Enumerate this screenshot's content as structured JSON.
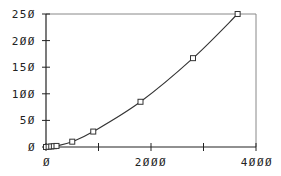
{
  "chart_data": {
    "type": "line",
    "title": "",
    "xlabel": "",
    "ylabel": "",
    "xlim": [
      0,
      4000
    ],
    "ylim": [
      0,
      250
    ],
    "grid": false,
    "legend": null,
    "x_ticks": [
      0,
      1000,
      2000,
      3000,
      4000
    ],
    "x_tick_labels": [
      "0",
      "",
      "2000",
      "",
      "4000"
    ],
    "y_ticks": [
      0,
      50,
      100,
      150,
      200,
      250
    ],
    "y_tick_labels": [
      "0",
      "50",
      "100",
      "150",
      "200",
      "250"
    ],
    "series": [
      {
        "name": "series-1",
        "marker": "square",
        "line": "smooth",
        "color": "#333333",
        "x": [
          0,
          50,
          100,
          150,
          200,
          500,
          900,
          1800,
          2800,
          3650
        ],
        "y": [
          0,
          0.5,
          1,
          1.5,
          2,
          10,
          29,
          85,
          167,
          250
        ]
      }
    ]
  },
  "display": {
    "x_labels": [
      "Ø",
      "2ØØØ",
      "4ØØØ"
    ],
    "y_labels": [
      "Ø",
      "5Ø",
      "1ØØ",
      "15Ø",
      "2ØØ",
      "25Ø"
    ]
  }
}
